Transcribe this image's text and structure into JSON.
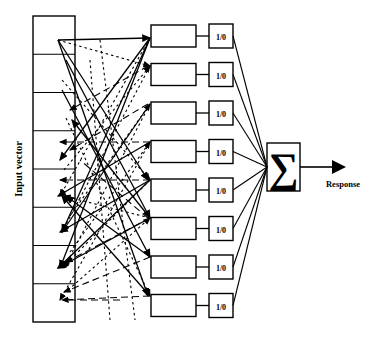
{
  "figure": {
    "type": "diagram",
    "background_color": "#ffffff",
    "stroke_color": "#000000"
  },
  "labels": {
    "input_vector": "Input vector",
    "response": "Response",
    "summation_symbol": "∑"
  },
  "input_layer": {
    "name": "Input vector",
    "cell_count": 8,
    "cells": [
      "",
      "",
      "",
      "",
      "",
      "",
      "",
      ""
    ],
    "geometry": {
      "x": 33,
      "y": 16,
      "width": 42,
      "height": 306
    }
  },
  "hidden_layer": {
    "node_count": 8,
    "nodes": [
      "",
      "",
      "",
      "",
      "",
      "",
      "",
      ""
    ],
    "geometry": {
      "x": 151,
      "y": 25,
      "width": 45,
      "height": 22,
      "spacing": 38.5
    }
  },
  "output_layer": {
    "node_count": 8,
    "label": "1/0",
    "nodes": [
      "1/0",
      "1/0",
      "1/0",
      "1/0",
      "1/0",
      "1/0",
      "1/0",
      "1/0"
    ],
    "geometry": {
      "x": 209,
      "y": 24,
      "width": 24,
      "height": 24,
      "spacing": 38.5
    }
  },
  "summation_node": {
    "symbol": "∑",
    "geometry": {
      "x": 267,
      "y": 143,
      "width": 33,
      "height": 48
    }
  },
  "response_arrow": {
    "label": "Response",
    "geometry": {
      "x1": 300,
      "y1": 167,
      "x2": 345,
      "y2": 167
    }
  },
  "connections": {
    "description": "Dense weighted links from input vector cells to hidden nodes",
    "styles": [
      "solid",
      "dashed",
      "dotted"
    ]
  }
}
